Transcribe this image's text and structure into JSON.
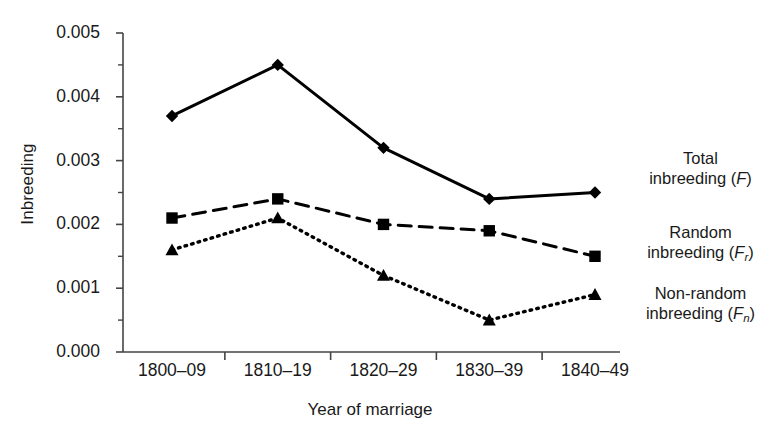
{
  "chart_data": {
    "type": "line",
    "title": "",
    "xlabel": "Year of marriage",
    "ylabel": "Inbreeding",
    "categories": [
      "1800–09",
      "1810–19",
      "1820–29",
      "1830–39",
      "1840–49"
    ],
    "ylim": [
      0.0,
      0.005
    ],
    "y_ticks": [
      "0.000",
      "0.001",
      "0.002",
      "0.003",
      "0.004",
      "0.005"
    ],
    "y_tick_values": [
      0.0,
      0.001,
      0.002,
      0.003,
      0.004,
      0.005
    ],
    "y_minor_tick_values": [
      0.0005,
      0.0015,
      0.0025,
      0.0035,
      0.0045
    ],
    "grid": false,
    "legend_position": "right",
    "series": [
      {
        "name": "Total inbreeding (F)",
        "name_plain": "Total inbreeding",
        "symbol": "F",
        "subscript": "",
        "marker": "diamond",
        "linestyle": "solid",
        "color": "#000000",
        "values": [
          0.0037,
          0.0045,
          0.0032,
          0.0024,
          0.0025
        ]
      },
      {
        "name": "Random inbreeding (Fr)",
        "name_plain": "Random inbreeding",
        "symbol": "F",
        "subscript": "r",
        "marker": "square",
        "linestyle": "dashed",
        "color": "#000000",
        "values": [
          0.0021,
          0.0024,
          0.002,
          0.0019,
          0.0015
        ]
      },
      {
        "name": "Non-random inbreeding (Fn)",
        "name_plain": "Non-random inbreeding",
        "symbol": "F",
        "subscript": "n",
        "marker": "triangle",
        "linestyle": "dotted",
        "color": "#000000",
        "values": [
          0.0016,
          0.0021,
          0.0012,
          0.0005,
          0.0009
        ]
      }
    ]
  },
  "legend": {
    "entries": [
      {
        "line1": "Total",
        "line2_prefix": "inbreeding (",
        "symbol": "F",
        "sub": "",
        "line2_suffix": ")"
      },
      {
        "line1": "Random",
        "line2_prefix": "inbreeding (",
        "symbol": "F",
        "sub": "r",
        "line2_suffix": ")"
      },
      {
        "line1": "Non-random",
        "line2_prefix": "inbreeding (",
        "symbol": "F",
        "sub": "n",
        "line2_suffix": ")"
      }
    ]
  }
}
